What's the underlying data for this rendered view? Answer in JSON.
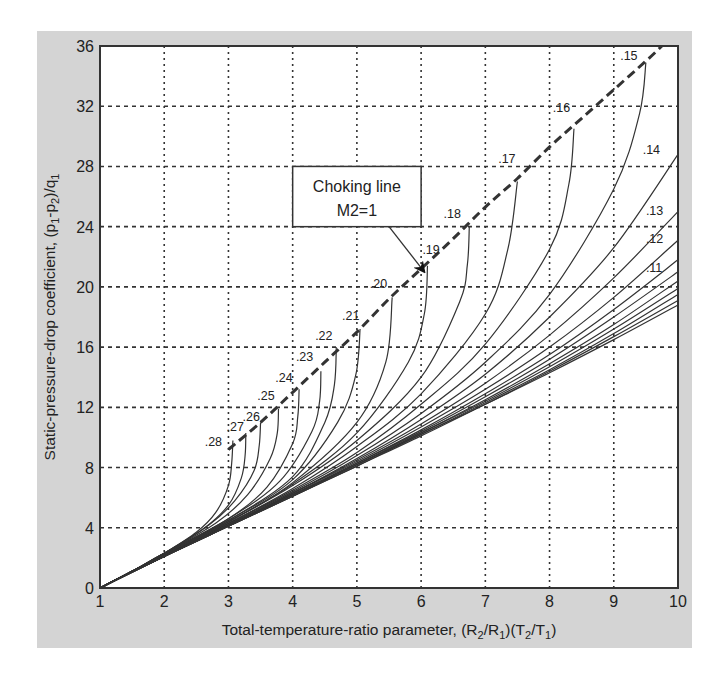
{
  "chart_data": {
    "type": "line",
    "title": "",
    "xlabel": "Total-temperature-ratio parameter, (R2/R1)(T2/T1)",
    "xlabel_parts": {
      "main": "Total-temperature-ratio parameter, (R",
      "s1": "2",
      "m2": "/R",
      "s2": "1",
      "m3": ")(T",
      "s3": "2",
      "m4": "/T",
      "s4": "1",
      "m5": ")"
    },
    "ylabel": "Static-pressure-drop coefficient, (p1-p2)/q1",
    "ylabel_parts": {
      "main": "Static-pressure-drop coefficient,  (p",
      "s1": "1",
      "m2": "-p",
      "s2": "2",
      "m3": ")/q",
      "s3": "1"
    },
    "xlim": [
      1,
      10
    ],
    "ylim": [
      0,
      36
    ],
    "xticks": [
      1,
      2,
      3,
      4,
      5,
      6,
      7,
      8,
      9,
      10
    ],
    "yticks": [
      0,
      4,
      8,
      12,
      16,
      20,
      24,
      28,
      32,
      36
    ],
    "grid": true,
    "legend": "none",
    "annotation": {
      "text_line1": "Choking line",
      "text_line2": "M2=1",
      "box": [
        4.0,
        28.0,
        6.0,
        24.0
      ],
      "arrow_from": [
        5.5,
        24.0
      ],
      "arrow_to": [
        6.05,
        21.0
      ]
    },
    "choking_line": {
      "name": "Choking line M2=1",
      "points": [
        [
          3.0,
          9.2
        ],
        [
          3.5,
          11.0
        ],
        [
          4.0,
          13.0
        ],
        [
          4.5,
          15.0
        ],
        [
          5.0,
          17.0
        ],
        [
          5.5,
          19.2
        ],
        [
          6.0,
          21.2
        ],
        [
          6.5,
          23.2
        ],
        [
          7.0,
          25.3
        ],
        [
          7.5,
          27.2
        ],
        [
          8.0,
          29.3
        ],
        [
          8.5,
          31.2
        ],
        [
          9.0,
          33.1
        ],
        [
          9.5,
          35.0
        ],
        [
          9.75,
          36.0
        ]
      ]
    },
    "series": [
      {
        "name": ".28",
        "label_at": [
          2.63,
          9.4
        ],
        "points": [
          [
            1,
            0
          ],
          [
            1.5,
            1.1
          ],
          [
            2,
            2.3
          ],
          [
            2.5,
            3.7
          ],
          [
            2.8,
            5.0
          ],
          [
            3.0,
            6.8
          ],
          [
            3.05,
            8.3
          ],
          [
            3.07,
            9.8
          ]
        ]
      },
      {
        "name": ".27",
        "label_at": [
          2.97,
          10.4
        ],
        "points": [
          [
            1,
            0
          ],
          [
            1.5,
            1.1
          ],
          [
            2,
            2.3
          ],
          [
            2.6,
            3.9
          ],
          [
            3.0,
            5.5
          ],
          [
            3.2,
            7.3
          ],
          [
            3.26,
            8.8
          ],
          [
            3.27,
            10.3
          ]
        ]
      },
      {
        "name": ".26",
        "label_at": [
          3.22,
          11.1
        ],
        "points": [
          [
            1,
            0
          ],
          [
            1.5,
            1.1
          ],
          [
            2,
            2.3
          ],
          [
            2.7,
            4.2
          ],
          [
            3.1,
            5.8
          ],
          [
            3.4,
            7.8
          ],
          [
            3.48,
            9.5
          ],
          [
            3.5,
            11.0
          ]
        ]
      },
      {
        "name": ".25",
        "label_at": [
          3.45,
          12.5
        ],
        "points": [
          [
            1,
            0
          ],
          [
            1.5,
            1.1
          ],
          [
            2,
            2.3
          ],
          [
            2.8,
            4.3
          ],
          [
            3.3,
            6.2
          ],
          [
            3.65,
            8.6
          ],
          [
            3.76,
            10.3
          ],
          [
            3.78,
            11.9
          ]
        ]
      },
      {
        "name": ".24",
        "label_at": [
          3.73,
          13.7
        ],
        "points": [
          [
            1,
            0
          ],
          [
            1.5,
            1.1
          ],
          [
            2,
            2.3
          ],
          [
            3.0,
            4.6
          ],
          [
            3.6,
            6.7
          ],
          [
            4.0,
            9.6
          ],
          [
            4.08,
            11.4
          ],
          [
            4.1,
            13.2
          ]
        ]
      },
      {
        "name": ".23",
        "label_at": [
          4.05,
          15.1
        ],
        "points": [
          [
            1,
            0
          ],
          [
            1.5,
            1.1
          ],
          [
            2,
            2.3
          ],
          [
            3.0,
            4.6
          ],
          [
            3.8,
            7.1
          ],
          [
            4.3,
            10.4
          ],
          [
            4.42,
            12.4
          ],
          [
            4.44,
            14.4
          ]
        ]
      },
      {
        "name": ".22",
        "label_at": [
          4.35,
          16.5
        ],
        "points": [
          [
            1,
            0
          ],
          [
            1.5,
            1.1
          ],
          [
            2,
            2.3
          ],
          [
            3.0,
            4.5
          ],
          [
            4.0,
            7.4
          ],
          [
            4.5,
            11.0
          ],
          [
            4.65,
            13.5
          ],
          [
            4.68,
            16.0
          ]
        ]
      },
      {
        "name": ".21",
        "label_at": [
          4.77,
          17.8
        ],
        "points": [
          [
            1,
            0
          ],
          [
            1.5,
            1.1
          ],
          [
            2,
            2.3
          ],
          [
            3.0,
            4.5
          ],
          [
            4.0,
            7.2
          ],
          [
            4.7,
            11.0
          ],
          [
            4.98,
            14.1
          ],
          [
            5.05,
            17.2
          ]
        ]
      },
      {
        "name": ".20",
        "label_at": [
          5.2,
          19.9
        ],
        "points": [
          [
            1,
            0
          ],
          [
            1.5,
            1.1
          ],
          [
            2,
            2.3
          ],
          [
            3.0,
            4.4
          ],
          [
            4.0,
            7.0
          ],
          [
            5.0,
            11.0
          ],
          [
            5.45,
            15.0
          ],
          [
            5.55,
            19.3
          ]
        ]
      },
      {
        "name": ".19",
        "label_at": [
          6.02,
          22.2
        ],
        "points": [
          [
            1,
            0
          ],
          [
            1.5,
            1.1
          ],
          [
            2,
            2.2
          ],
          [
            3.0,
            4.4
          ],
          [
            4.0,
            6.9
          ],
          [
            5.0,
            10.3
          ],
          [
            5.8,
            15.0
          ],
          [
            6.05,
            18.2
          ],
          [
            6.1,
            21.4
          ]
        ]
      },
      {
        "name": ".18",
        "label_at": [
          6.35,
          24.6
        ],
        "points": [
          [
            1,
            0
          ],
          [
            1.5,
            1.1
          ],
          [
            2,
            2.2
          ],
          [
            3.0,
            4.4
          ],
          [
            4.0,
            6.8
          ],
          [
            5.0,
            9.8
          ],
          [
            6.0,
            14.0
          ],
          [
            6.6,
            19.0
          ],
          [
            6.72,
            21.5
          ],
          [
            6.75,
            24.0
          ]
        ]
      },
      {
        "name": ".17",
        "label_at": [
          7.2,
          28.2
        ],
        "points": [
          [
            1,
            0
          ],
          [
            1.5,
            1.1
          ],
          [
            2,
            2.2
          ],
          [
            3.0,
            4.3
          ],
          [
            4.0,
            6.6
          ],
          [
            5.0,
            9.4
          ],
          [
            6.0,
            12.9
          ],
          [
            7.0,
            18.2
          ],
          [
            7.35,
            22.5
          ],
          [
            7.5,
            27.0
          ]
        ]
      },
      {
        "name": ".16",
        "label_at": [
          8.05,
          31.6
        ],
        "points": [
          [
            1,
            0
          ],
          [
            1.5,
            1.1
          ],
          [
            2,
            2.2
          ],
          [
            3.0,
            4.3
          ],
          [
            4.0,
            6.5
          ],
          [
            5.0,
            9.0
          ],
          [
            6.0,
            12.2
          ],
          [
            7.0,
            16.2
          ],
          [
            8.0,
            22.5
          ],
          [
            8.3,
            26.8
          ],
          [
            8.38,
            30.5
          ]
        ]
      },
      {
        "name": ".15",
        "label_at": [
          9.1,
          35.1
        ],
        "points": [
          [
            1,
            0
          ],
          [
            1.5,
            1.1
          ],
          [
            2,
            2.2
          ],
          [
            3.0,
            4.3
          ],
          [
            4.0,
            6.4
          ],
          [
            5.0,
            8.8
          ],
          [
            6.0,
            11.6
          ],
          [
            7.0,
            15.0
          ],
          [
            8.0,
            19.5
          ],
          [
            9.0,
            26.5
          ],
          [
            9.4,
            31.5
          ],
          [
            9.5,
            34.9
          ]
        ]
      },
      {
        "name": ".14",
        "label_at": [
          9.45,
          28.8
        ],
        "points": [
          [
            1,
            0
          ],
          [
            1.5,
            1.1
          ],
          [
            2,
            2.2
          ],
          [
            3.0,
            4.2
          ],
          [
            4.0,
            6.3
          ],
          [
            5.0,
            8.6
          ],
          [
            6.0,
            11.2
          ],
          [
            7.0,
            14.2
          ],
          [
            8.0,
            18.0
          ],
          [
            9.0,
            22.6
          ],
          [
            10.0,
            28.8
          ]
        ]
      },
      {
        "name": ".13",
        "label_at": [
          9.5,
          24.8
        ],
        "points": [
          [
            1,
            0
          ],
          [
            1.5,
            1.1
          ],
          [
            2,
            2.1
          ],
          [
            3.0,
            4.2
          ],
          [
            4.0,
            6.3
          ],
          [
            5.0,
            8.5
          ],
          [
            6.0,
            10.9
          ],
          [
            7.0,
            13.6
          ],
          [
            8.0,
            16.8
          ],
          [
            9.0,
            20.6
          ],
          [
            10.0,
            25.0
          ]
        ]
      },
      {
        "name": ".12",
        "label_at": [
          9.5,
          22.9
        ],
        "points": [
          [
            1,
            0
          ],
          [
            1.5,
            1.1
          ],
          [
            2,
            2.1
          ],
          [
            3.0,
            4.2
          ],
          [
            4.0,
            6.3
          ],
          [
            5.0,
            8.4
          ],
          [
            6.0,
            10.7
          ],
          [
            7.0,
            13.2
          ],
          [
            8.0,
            16.0
          ],
          [
            9.0,
            19.3
          ],
          [
            10.0,
            23.1
          ]
        ]
      },
      {
        "name": ".11",
        "label_at": [
          9.5,
          21.0
        ],
        "points": [
          [
            1,
            0
          ],
          [
            1.5,
            1.1
          ],
          [
            2,
            2.1
          ],
          [
            3.0,
            4.2
          ],
          [
            4.0,
            6.2
          ],
          [
            5.0,
            8.3
          ],
          [
            6.0,
            10.5
          ],
          [
            7.0,
            12.9
          ],
          [
            8.0,
            15.5
          ],
          [
            9.0,
            18.5
          ],
          [
            10.0,
            21.8
          ]
        ]
      },
      {
        "name": "",
        "label_at": null,
        "points": [
          [
            1,
            0
          ],
          [
            2,
            2.1
          ],
          [
            3.0,
            4.2
          ],
          [
            4.0,
            6.2
          ],
          [
            5.0,
            8.3
          ],
          [
            6.0,
            10.4
          ],
          [
            7.0,
            12.7
          ],
          [
            8.0,
            15.2
          ],
          [
            9.0,
            18.0
          ],
          [
            10.0,
            21.0
          ]
        ]
      },
      {
        "name": "",
        "label_at": null,
        "points": [
          [
            1,
            0
          ],
          [
            2,
            2.1
          ],
          [
            3.0,
            4.2
          ],
          [
            4.0,
            6.2
          ],
          [
            5.0,
            8.2
          ],
          [
            6.0,
            10.3
          ],
          [
            7.0,
            12.5
          ],
          [
            8.0,
            14.9
          ],
          [
            9.0,
            17.5
          ],
          [
            10.0,
            20.4
          ]
        ]
      },
      {
        "name": "",
        "label_at": null,
        "points": [
          [
            1,
            0
          ],
          [
            2,
            2.1
          ],
          [
            3.0,
            4.1
          ],
          [
            4.0,
            6.2
          ],
          [
            5.0,
            8.2
          ],
          [
            6.0,
            10.3
          ],
          [
            7.0,
            12.4
          ],
          [
            8.0,
            14.7
          ],
          [
            9.0,
            17.2
          ],
          [
            10.0,
            19.9
          ]
        ]
      },
      {
        "name": "",
        "label_at": null,
        "points": [
          [
            1,
            0
          ],
          [
            2,
            2.1
          ],
          [
            3.0,
            4.1
          ],
          [
            4.0,
            6.1
          ],
          [
            5.0,
            8.2
          ],
          [
            6.0,
            10.2
          ],
          [
            7.0,
            12.3
          ],
          [
            8.0,
            14.5
          ],
          [
            9.0,
            16.9
          ],
          [
            10.0,
            19.5
          ]
        ]
      },
      {
        "name": "",
        "label_at": null,
        "points": [
          [
            1,
            0
          ],
          [
            2,
            2.1
          ],
          [
            3.0,
            4.1
          ],
          [
            4.0,
            6.1
          ],
          [
            5.0,
            8.1
          ],
          [
            6.0,
            10.2
          ],
          [
            7.0,
            12.2
          ],
          [
            8.0,
            14.4
          ],
          [
            9.0,
            16.7
          ],
          [
            10.0,
            19.1
          ]
        ]
      },
      {
        "name": "",
        "label_at": null,
        "points": [
          [
            1,
            0
          ],
          [
            2,
            2.1
          ],
          [
            3.0,
            4.1
          ],
          [
            4.0,
            6.1
          ],
          [
            5.0,
            8.1
          ],
          [
            6.0,
            10.1
          ],
          [
            7.0,
            12.2
          ],
          [
            8.0,
            14.3
          ],
          [
            9.0,
            16.5
          ],
          [
            10.0,
            18.8
          ]
        ]
      }
    ],
    "colors": {
      "panel": "#d4d4d4",
      "plot_bg": "#ffffff",
      "line": "#333333",
      "grid": "#333333",
      "text": "#222222"
    }
  }
}
